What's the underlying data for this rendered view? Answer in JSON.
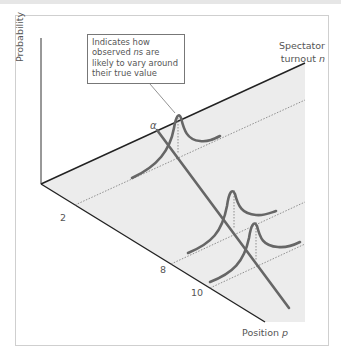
{
  "diagram": {
    "y_axis_label": "Probability",
    "n_axis_label_line1": "Spectator",
    "n_axis_label_line2": "turnout",
    "n_axis_var": "n",
    "p_axis_label": "Position",
    "p_axis_var": "p",
    "alpha_label": "α",
    "p_ticks": [
      "2",
      "8",
      "10"
    ],
    "callout": {
      "lines": [
        "Indicates how",
        "observed ",
        "likely to vary around",
        "their true value"
      ],
      "line2_var": "n",
      "line2_suffix": "s are"
    },
    "colors": {
      "plane": "#ececec",
      "axis": "#222222",
      "curve": "#666666",
      "dotted": "#777777",
      "frame": "#cfcfcf"
    }
  }
}
